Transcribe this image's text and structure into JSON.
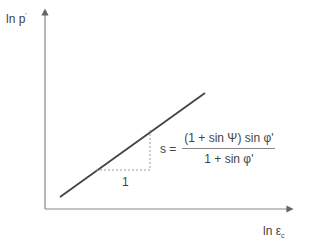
{
  "diagram": {
    "y_axis_label": "ln p",
    "y_axis_label_sup": "'",
    "x_axis_label": "ln ε",
    "x_axis_label_sub": "c",
    "slope_run_label": "1",
    "formula": {
      "lhs": "s =",
      "numerator": "(1 + sin Ψ) sin φ'",
      "denominator": "1 + sin φ'"
    },
    "colors": {
      "axis": "#888888",
      "line": "#444444",
      "dashed": "#999999",
      "text": "#444444"
    }
  }
}
